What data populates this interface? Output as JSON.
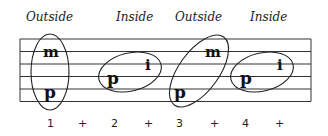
{
  "diagram": {
    "type": "guitar-tab-finger-pattern",
    "headers": [
      "Outside",
      "Inside",
      "Outside",
      "Inside"
    ],
    "staff": {
      "line_count": 6
    },
    "groups": [
      {
        "label": "Outside",
        "fingers": [
          {
            "name": "m"
          },
          {
            "name": "p"
          }
        ]
      },
      {
        "label": "Inside",
        "fingers": [
          {
            "name": "p"
          },
          {
            "name": "i"
          }
        ]
      },
      {
        "label": "Outside",
        "fingers": [
          {
            "name": "p"
          },
          {
            "name": "m"
          }
        ]
      },
      {
        "label": "Inside",
        "fingers": [
          {
            "name": "p"
          },
          {
            "name": "i"
          }
        ]
      }
    ],
    "counts": [
      "1",
      "+",
      "2",
      "+",
      "3",
      "+",
      "4",
      "+"
    ],
    "colors": {
      "ink": "#222222",
      "background": "#ffffff"
    }
  }
}
